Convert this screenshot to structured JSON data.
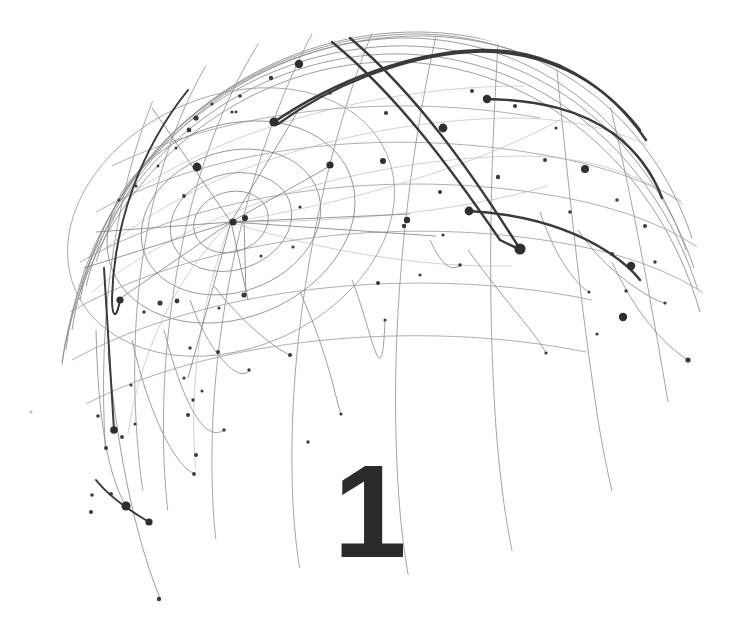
{
  "page": {
    "kind": "chapter-opener-illustration",
    "background_color": "#ffffff",
    "width": 738,
    "height": 642
  },
  "chapter": {
    "number": "1",
    "number_color": "#2b2b2b"
  },
  "illustration": {
    "name": "network-sphere",
    "description": "Wireframe hemisphere of thin arcs with scattered node dots, a convergence hub at upper-left-of-center, concentric orbit ellipses, and several emphasized dark arcs ending in large dots",
    "palette": {
      "thin_arc": "#8d8d8d",
      "faint_arc": "#bdbdbd",
      "mid_arc": "#6e6e6e",
      "bold_arc": "#3a3a3a",
      "node": "#2f2f2f",
      "node_small": "#3b3b3b"
    },
    "sphere": {
      "center_x": 378,
      "center_y": 300,
      "radius_x": 322,
      "radius_y": 272
    },
    "hub": {
      "x": 231,
      "y": 222
    },
    "orbit_rings": [
      {
        "rx": 38,
        "ry": 30,
        "rot": -18
      },
      {
        "rx": 62,
        "ry": 48,
        "rot": -18
      },
      {
        "rx": 92,
        "ry": 70,
        "rot": -20
      },
      {
        "rx": 128,
        "ry": 96,
        "rot": -22
      },
      {
        "rx": 170,
        "ry": 126,
        "rot": -24
      }
    ],
    "counts": {
      "thin_arcs": 34,
      "bold_arcs": 6,
      "nodes": 86
    }
  },
  "chart_data": {
    "type": "scatter",
    "title": "",
    "xlabel": "",
    "ylabel": "",
    "grid": false,
    "legend": null,
    "nodes": [
      {
        "x": 299,
        "y": 64,
        "r": 4.2,
        "tone": "dark"
      },
      {
        "x": 274,
        "y": 122,
        "r": 4.6,
        "tone": "dark"
      },
      {
        "x": 271,
        "y": 78,
        "r": 2.2,
        "tone": "dark"
      },
      {
        "x": 240,
        "y": 96,
        "r": 1.8,
        "tone": "dark"
      },
      {
        "x": 232,
        "y": 112,
        "r": 1.6,
        "tone": "dark"
      },
      {
        "x": 212,
        "y": 104,
        "r": 1.6,
        "tone": "dark"
      },
      {
        "x": 196,
        "y": 118,
        "r": 2.6,
        "tone": "dark"
      },
      {
        "x": 189,
        "y": 130,
        "r": 2.4,
        "tone": "dark"
      },
      {
        "x": 176,
        "y": 148,
        "r": 1.5,
        "tone": "dark"
      },
      {
        "x": 197,
        "y": 167,
        "r": 4.4,
        "tone": "dark"
      },
      {
        "x": 158,
        "y": 166,
        "r": 1.5,
        "tone": "dark"
      },
      {
        "x": 136,
        "y": 186,
        "r": 1.6,
        "tone": "dark"
      },
      {
        "x": 119,
        "y": 200,
        "r": 1.5,
        "tone": "dark"
      },
      {
        "x": 184,
        "y": 196,
        "r": 1.9,
        "tone": "dark"
      },
      {
        "x": 233,
        "y": 222,
        "r": 3.6,
        "tone": "dark"
      },
      {
        "x": 245,
        "y": 218,
        "r": 3.0,
        "tone": "dark"
      },
      {
        "x": 330,
        "y": 165,
        "r": 3.6,
        "tone": "dark"
      },
      {
        "x": 383,
        "y": 161,
        "r": 3.0,
        "tone": "dark"
      },
      {
        "x": 386,
        "y": 113,
        "r": 2.1,
        "tone": "dark"
      },
      {
        "x": 407,
        "y": 220,
        "r": 3.2,
        "tone": "dark"
      },
      {
        "x": 443,
        "y": 128,
        "r": 4.4,
        "tone": "dark"
      },
      {
        "x": 440,
        "y": 192,
        "r": 2.0,
        "tone": "dark"
      },
      {
        "x": 469,
        "y": 211,
        "r": 4.4,
        "tone": "dark"
      },
      {
        "x": 487,
        "y": 99,
        "r": 4.2,
        "tone": "dark"
      },
      {
        "x": 472,
        "y": 91,
        "r": 2.0,
        "tone": "dark"
      },
      {
        "x": 515,
        "y": 106,
        "r": 2.1,
        "tone": "dark"
      },
      {
        "x": 520,
        "y": 249,
        "r": 5.6,
        "tone": "dark"
      },
      {
        "x": 498,
        "y": 177,
        "r": 2.2,
        "tone": "dark"
      },
      {
        "x": 545,
        "y": 160,
        "r": 2.0,
        "tone": "dark"
      },
      {
        "x": 585,
        "y": 169,
        "r": 4.0,
        "tone": "dark"
      },
      {
        "x": 570,
        "y": 212,
        "r": 1.8,
        "tone": "dark"
      },
      {
        "x": 617,
        "y": 200,
        "r": 1.8,
        "tone": "dark"
      },
      {
        "x": 631,
        "y": 266,
        "r": 4.2,
        "tone": "dark"
      },
      {
        "x": 612,
        "y": 254,
        "r": 2.0,
        "tone": "dark"
      },
      {
        "x": 655,
        "y": 262,
        "r": 1.7,
        "tone": "dark"
      },
      {
        "x": 645,
        "y": 226,
        "r": 2.0,
        "tone": "dark"
      },
      {
        "x": 623,
        "y": 317,
        "r": 4.2,
        "tone": "dark"
      },
      {
        "x": 626,
        "y": 291,
        "r": 1.7,
        "tone": "dark"
      },
      {
        "x": 688,
        "y": 360,
        "r": 2.6,
        "tone": "dark"
      },
      {
        "x": 597,
        "y": 334,
        "r": 1.6,
        "tone": "dark"
      },
      {
        "x": 300,
        "y": 207,
        "r": 1.6,
        "tone": "dark"
      },
      {
        "x": 293,
        "y": 247,
        "r": 1.6,
        "tone": "dark"
      },
      {
        "x": 261,
        "y": 256,
        "r": 1.5,
        "tone": "dark"
      },
      {
        "x": 244,
        "y": 295,
        "r": 2.6,
        "tone": "dark"
      },
      {
        "x": 219,
        "y": 308,
        "r": 1.6,
        "tone": "dark"
      },
      {
        "x": 218,
        "y": 352,
        "r": 2.0,
        "tone": "dark"
      },
      {
        "x": 190,
        "y": 348,
        "r": 1.7,
        "tone": "dark"
      },
      {
        "x": 177,
        "y": 301,
        "r": 2.4,
        "tone": "dark"
      },
      {
        "x": 160,
        "y": 303,
        "r": 2.6,
        "tone": "dark"
      },
      {
        "x": 144,
        "y": 312,
        "r": 1.7,
        "tone": "dark"
      },
      {
        "x": 131,
        "y": 385,
        "r": 1.6,
        "tone": "dark"
      },
      {
        "x": 120,
        "y": 300,
        "r": 3.6,
        "tone": "dark"
      },
      {
        "x": 114,
        "y": 430,
        "r": 3.8,
        "tone": "dark"
      },
      {
        "x": 98,
        "y": 416,
        "r": 1.8,
        "tone": "dark"
      },
      {
        "x": 106,
        "y": 448,
        "r": 2.0,
        "tone": "dark"
      },
      {
        "x": 122,
        "y": 437,
        "r": 1.9,
        "tone": "dark"
      },
      {
        "x": 135,
        "y": 424,
        "r": 1.6,
        "tone": "dark"
      },
      {
        "x": 193,
        "y": 400,
        "r": 1.7,
        "tone": "dark"
      },
      {
        "x": 188,
        "y": 415,
        "r": 2.0,
        "tone": "dark"
      },
      {
        "x": 202,
        "y": 391,
        "r": 1.5,
        "tone": "dark"
      },
      {
        "x": 159,
        "y": 599,
        "r": 2.2,
        "tone": "dark"
      },
      {
        "x": 126,
        "y": 506,
        "r": 4.6,
        "tone": "dark"
      },
      {
        "x": 111,
        "y": 494,
        "r": 2.0,
        "tone": "dark"
      },
      {
        "x": 149,
        "y": 522,
        "r": 3.6,
        "tone": "dark"
      },
      {
        "x": 92,
        "y": 495,
        "r": 1.8,
        "tone": "dark"
      },
      {
        "x": 91,
        "y": 512,
        "r": 2.0,
        "tone": "dark"
      },
      {
        "x": 31,
        "y": 412,
        "r": 1.5,
        "tone": "faint"
      },
      {
        "x": 184,
        "y": 378,
        "r": 1.6,
        "tone": "dark"
      },
      {
        "x": 249,
        "y": 370,
        "r": 1.7,
        "tone": "dark"
      },
      {
        "x": 224,
        "y": 430,
        "r": 1.7,
        "tone": "dark"
      },
      {
        "x": 196,
        "y": 455,
        "r": 2.0,
        "tone": "dark"
      },
      {
        "x": 194,
        "y": 474,
        "r": 1.9,
        "tone": "dark"
      },
      {
        "x": 290,
        "y": 355,
        "r": 2.0,
        "tone": "dark"
      },
      {
        "x": 378,
        "y": 283,
        "r": 2.0,
        "tone": "dark"
      },
      {
        "x": 385,
        "y": 320,
        "r": 1.6,
        "tone": "dark"
      },
      {
        "x": 404,
        "y": 226,
        "r": 2.2,
        "tone": "dark"
      },
      {
        "x": 443,
        "y": 235,
        "r": 1.6,
        "tone": "dark"
      },
      {
        "x": 460,
        "y": 265,
        "r": 1.8,
        "tone": "dark"
      },
      {
        "x": 420,
        "y": 275,
        "r": 1.6,
        "tone": "dark"
      },
      {
        "x": 341,
        "y": 414,
        "r": 1.6,
        "tone": "dark"
      },
      {
        "x": 308,
        "y": 442,
        "r": 1.7,
        "tone": "dark"
      },
      {
        "x": 236,
        "y": 112,
        "r": 1.4,
        "tone": "dark"
      },
      {
        "x": 330,
        "y": 93,
        "r": 1.8,
        "tone": "dark"
      },
      {
        "x": 556,
        "y": 128,
        "r": 1.6,
        "tone": "dark"
      },
      {
        "x": 665,
        "y": 303,
        "r": 1.6,
        "tone": "dark"
      },
      {
        "x": 589,
        "y": 292,
        "r": 1.5,
        "tone": "dark"
      },
      {
        "x": 546,
        "y": 353,
        "r": 1.6,
        "tone": "dark"
      }
    ]
  }
}
